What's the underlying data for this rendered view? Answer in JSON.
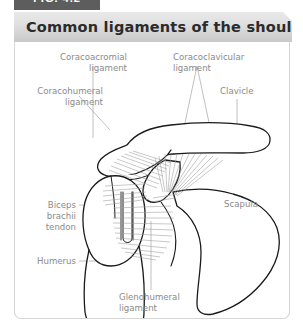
{
  "figure": {
    "tab_label": "FIG. 4.2",
    "title": "Common ligaments of the shoulder"
  },
  "colors": {
    "tab_background": "#5d5d5d",
    "title_bar_light": "#e9e9e9",
    "title_bar_dark": "#c9c9c9",
    "title_text": "#2b2b2b",
    "label_text": "#8a8a8a",
    "frame_border": "#d6d6d6",
    "bone_outline": "#1a1a1a",
    "ligament_fiber": "#9a9a9a",
    "leader_line": "#b0b0b0",
    "page_background": "#ffffff"
  },
  "labels": {
    "coracoacromial": "Coracoacromial\nligament",
    "coracoacromial_line1": "Coracoacromial",
    "coracoacromial_line2": "ligament",
    "coracoclavicular_line1": "Coracoclavicular",
    "coracoclavicular_line2": "ligament",
    "coracohumeral_line1": "Coracohumeral",
    "coracohumeral_line2": "ligament",
    "clavicle": "Clavicle",
    "biceps_line1": "Biceps",
    "biceps_line2": "brachii",
    "biceps_line3": "tendon",
    "humerus": "Humerus",
    "scapula": "Scapula",
    "glenohumeral_line1": "Glenohumeral",
    "glenohumeral_line2": "ligament"
  },
  "anatomy": {
    "structures": [
      "clavicle",
      "acromion",
      "coracoid process",
      "scapula",
      "humerus",
      "humeral head",
      "greater tubercle",
      "bicipital groove",
      "biceps brachii tendon",
      "coracoacromial ligament",
      "coracoclavicular ligament",
      "coracohumeral ligament",
      "glenohumeral ligament"
    ]
  }
}
